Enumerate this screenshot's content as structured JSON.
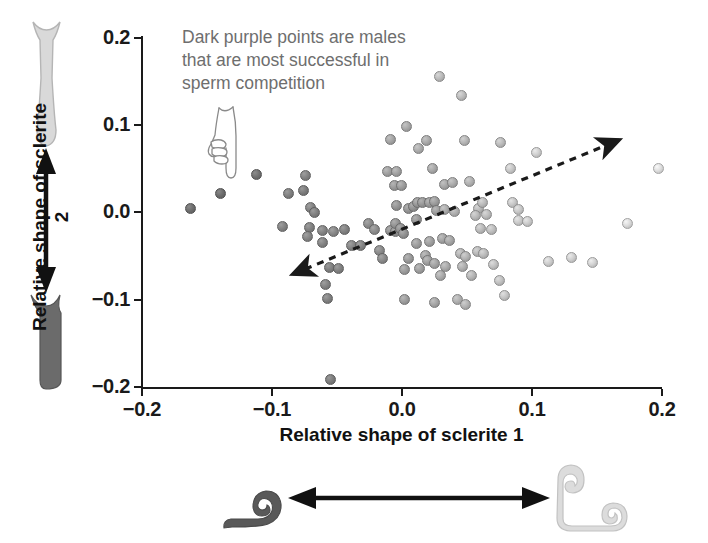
{
  "figure": {
    "background": "#ffffff"
  },
  "annotation": {
    "line1": "Dark purple points are males",
    "line2": "that are most successful in",
    "line3": "sperm competition",
    "color": "#6e6e6e"
  },
  "axes": {
    "xlabel": "Relative shape of sclerite 1",
    "ylabel": "Relative shape of sclerite 2",
    "x_ticks": [
      "−0.2",
      "−0.1",
      "0.0",
      "0.1",
      "0.2"
    ],
    "y_ticks": [
      "0.2",
      "0.1",
      "0.0",
      "−0.1",
      "−0.2"
    ],
    "axis_color": "#1a1a1a"
  },
  "icons": {
    "pointing_hand": "pointing-hand-icon",
    "trend_arrow": "double-headed-dashed-arrow",
    "vertical_arrow": "double-headed-vertical-arrow",
    "horizontal_arrow": "double-headed-horizontal-arrow"
  },
  "sclerite_shapes": {
    "sclerite2_light_label": "sclerite-2-light-morph",
    "sclerite2_dark_label": "sclerite-2-dark-morph",
    "sclerite1_dark_label": "sclerite-1-dark-morph",
    "sclerite1_light_label": "sclerite-1-light-morph",
    "dark_color": "#5a5a5a",
    "light_color": "#d6d6d6"
  },
  "chart_data": {
    "type": "scatter",
    "title": "",
    "xlabel": "Relative shape of sclerite 1",
    "ylabel": "Relative shape of sclerite 2",
    "xlim": [
      -0.2,
      0.2
    ],
    "ylim": [
      -0.2,
      0.2
    ],
    "xticks": [
      -0.2,
      -0.1,
      0.0,
      0.1,
      0.2
    ],
    "yticks": [
      -0.2,
      -0.1,
      0.0,
      0.1,
      0.2
    ],
    "grid": false,
    "legend": null,
    "annotations": [
      {
        "text": "Dark purple points are males that are most successful in sperm competition",
        "x": -0.155,
        "y": 0.185
      }
    ],
    "trend_arrow": {
      "style": "dashed double-headed",
      "from": [
        -0.088,
        -0.065
      ],
      "to": [
        0.17,
        0.035
      ]
    },
    "shade_note": "Point darkness encodes sperm competition success: dark = most successful, light = least.",
    "points": [
      {
        "x": -0.162,
        "y": 0.005,
        "shade": 0.1
      },
      {
        "x": -0.139,
        "y": 0.022,
        "shade": 0.09
      },
      {
        "x": -0.111,
        "y": 0.043,
        "shade": 0.12
      },
      {
        "x": -0.086,
        "y": 0.022,
        "shade": 0.22
      },
      {
        "x": -0.075,
        "y": 0.025,
        "shade": 0.2
      },
      {
        "x": -0.073,
        "y": 0.042,
        "shade": 0.24
      },
      {
        "x": -0.069,
        "y": 0.006,
        "shade": 0.25
      },
      {
        "x": -0.066,
        "y": 0.0,
        "shade": 0.22
      },
      {
        "x": -0.091,
        "y": -0.016,
        "shade": 0.24
      },
      {
        "x": -0.07,
        "y": -0.017,
        "shade": 0.23
      },
      {
        "x": -0.072,
        "y": -0.027,
        "shade": 0.26
      },
      {
        "x": -0.06,
        "y": -0.021,
        "shade": 0.25
      },
      {
        "x": -0.052,
        "y": -0.022,
        "shade": 0.27
      },
      {
        "x": -0.043,
        "y": -0.019,
        "shade": 0.23
      },
      {
        "x": -0.06,
        "y": -0.034,
        "shade": 0.24
      },
      {
        "x": -0.038,
        "y": -0.038,
        "shade": 0.26
      },
      {
        "x": -0.031,
        "y": -0.038,
        "shade": 0.25
      },
      {
        "x": -0.055,
        "y": -0.063,
        "shade": 0.22
      },
      {
        "x": -0.048,
        "y": -0.064,
        "shade": 0.23
      },
      {
        "x": -0.058,
        "y": -0.082,
        "shade": 0.24
      },
      {
        "x": -0.056,
        "y": -0.098,
        "shade": 0.23
      },
      {
        "x": -0.054,
        "y": -0.191,
        "shade": 0.2
      },
      {
        "x": -0.025,
        "y": -0.013,
        "shade": 0.3
      },
      {
        "x": -0.02,
        "y": -0.02,
        "shade": 0.31
      },
      {
        "x": -0.016,
        "y": -0.043,
        "shade": 0.3
      },
      {
        "x": -0.014,
        "y": -0.053,
        "shade": 0.29
      },
      {
        "x": -0.008,
        "y": -0.021,
        "shade": 0.33
      },
      {
        "x": -0.004,
        "y": -0.022,
        "shade": 0.34
      },
      {
        "x": -0.004,
        "y": -0.013,
        "shade": 0.35
      },
      {
        "x": 0.0,
        "y": -0.018,
        "shade": 0.33
      },
      {
        "x": 0.002,
        "y": -0.024,
        "shade": 0.34
      },
      {
        "x": -0.003,
        "y": 0.008,
        "shade": 0.36
      },
      {
        "x": 0.006,
        "y": 0.005,
        "shade": 0.37
      },
      {
        "x": 0.01,
        "y": 0.007,
        "shade": 0.35
      },
      {
        "x": 0.013,
        "y": 0.011,
        "shade": 0.38
      },
      {
        "x": 0.017,
        "y": 0.012,
        "shade": 0.37
      },
      {
        "x": 0.022,
        "y": 0.012,
        "shade": 0.4
      },
      {
        "x": 0.026,
        "y": 0.013,
        "shade": 0.41
      },
      {
        "x": 0.012,
        "y": -0.008,
        "shade": 0.38
      },
      {
        "x": 0.028,
        "y": 0.002,
        "shade": 0.42
      },
      {
        "x": -0.005,
        "y": 0.031,
        "shade": 0.4
      },
      {
        "x": 0.001,
        "y": 0.031,
        "shade": 0.41
      },
      {
        "x": -0.01,
        "y": 0.047,
        "shade": 0.44
      },
      {
        "x": -0.003,
        "y": 0.047,
        "shade": 0.45
      },
      {
        "x": -0.008,
        "y": 0.084,
        "shade": 0.47
      },
      {
        "x": 0.005,
        "y": 0.098,
        "shade": 0.5
      },
      {
        "x": 0.014,
        "y": 0.073,
        "shade": 0.52
      },
      {
        "x": 0.02,
        "y": 0.083,
        "shade": 0.5
      },
      {
        "x": 0.03,
        "y": 0.156,
        "shade": 0.62
      },
      {
        "x": 0.047,
        "y": 0.134,
        "shade": 0.63
      },
      {
        "x": 0.025,
        "y": 0.05,
        "shade": 0.49
      },
      {
        "x": 0.034,
        "y": 0.032,
        "shade": 0.48
      },
      {
        "x": 0.04,
        "y": 0.034,
        "shade": 0.52
      },
      {
        "x": 0.049,
        "y": 0.082,
        "shade": 0.58
      },
      {
        "x": 0.077,
        "y": 0.08,
        "shade": 0.62
      },
      {
        "x": 0.034,
        "y": 0.003,
        "shade": 0.52
      },
      {
        "x": 0.042,
        "y": 0.001,
        "shade": 0.54
      },
      {
        "x": 0.053,
        "y": 0.035,
        "shade": 0.56
      },
      {
        "x": 0.06,
        "y": 0.005,
        "shade": 0.6
      },
      {
        "x": 0.063,
        "y": 0.011,
        "shade": 0.62
      },
      {
        "x": 0.058,
        "y": -0.004,
        "shade": 0.61
      },
      {
        "x": 0.066,
        "y": -0.002,
        "shade": 0.63
      },
      {
        "x": 0.012,
        "y": -0.035,
        "shade": 0.42
      },
      {
        "x": 0.022,
        "y": -0.033,
        "shade": 0.44
      },
      {
        "x": 0.032,
        "y": -0.03,
        "shade": 0.46
      },
      {
        "x": 0.038,
        "y": -0.032,
        "shade": 0.48
      },
      {
        "x": 0.019,
        "y": -0.049,
        "shade": 0.45
      },
      {
        "x": 0.021,
        "y": -0.055,
        "shade": 0.44
      },
      {
        "x": 0.026,
        "y": -0.058,
        "shade": 0.46
      },
      {
        "x": 0.006,
        "y": -0.053,
        "shade": 0.4
      },
      {
        "x": 0.003,
        "y": -0.065,
        "shade": 0.41
      },
      {
        "x": 0.015,
        "y": -0.064,
        "shade": 0.43
      },
      {
        "x": 0.035,
        "y": -0.062,
        "shade": 0.5
      },
      {
        "x": 0.031,
        "y": -0.072,
        "shade": 0.51
      },
      {
        "x": 0.046,
        "y": -0.047,
        "shade": 0.56
      },
      {
        "x": 0.05,
        "y": -0.05,
        "shade": 0.57
      },
      {
        "x": 0.048,
        "y": -0.062,
        "shade": 0.55
      },
      {
        "x": 0.055,
        "y": -0.072,
        "shade": 0.58
      },
      {
        "x": 0.059,
        "y": -0.045,
        "shade": 0.6
      },
      {
        "x": 0.064,
        "y": -0.047,
        "shade": 0.62
      },
      {
        "x": 0.062,
        "y": -0.018,
        "shade": 0.62
      },
      {
        "x": 0.07,
        "y": -0.02,
        "shade": 0.64
      },
      {
        "x": 0.072,
        "y": -0.06,
        "shade": 0.66
      },
      {
        "x": 0.076,
        "y": -0.078,
        "shade": 0.66
      },
      {
        "x": 0.026,
        "y": -0.103,
        "shade": 0.47
      },
      {
        "x": 0.044,
        "y": -0.1,
        "shade": 0.55
      },
      {
        "x": 0.05,
        "y": -0.105,
        "shade": 0.56
      },
      {
        "x": 0.003,
        "y": -0.1,
        "shade": 0.42
      },
      {
        "x": 0.08,
        "y": -0.095,
        "shade": 0.68
      },
      {
        "x": 0.114,
        "y": -0.056,
        "shade": 0.74
      },
      {
        "x": 0.132,
        "y": -0.052,
        "shade": 0.76
      },
      {
        "x": 0.148,
        "y": -0.057,
        "shade": 0.78
      },
      {
        "x": 0.085,
        "y": 0.051,
        "shade": 0.7
      },
      {
        "x": 0.086,
        "y": 0.012,
        "shade": 0.7
      },
      {
        "x": 0.091,
        "y": 0.004,
        "shade": 0.71
      },
      {
        "x": 0.091,
        "y": -0.009,
        "shade": 0.72
      },
      {
        "x": 0.098,
        "y": -0.01,
        "shade": 0.73
      },
      {
        "x": 0.105,
        "y": 0.069,
        "shade": 0.76
      },
      {
        "x": 0.199,
        "y": 0.05,
        "shade": 0.86
      },
      {
        "x": 0.175,
        "y": -0.013,
        "shade": 0.84
      }
    ]
  }
}
